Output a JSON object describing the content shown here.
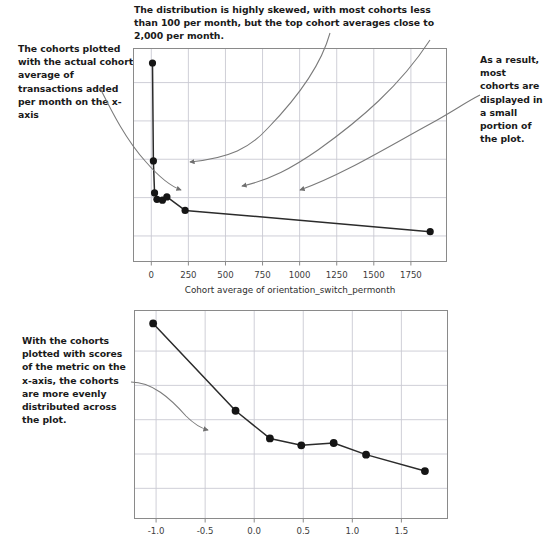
{
  "annotations": {
    "caption_top": "The distribution is highly skewed, with most cohorts less than 100 per month, but the top cohort averages close to 2,000 per month.",
    "left_top": "The cohorts plotted with the actual cohort average of transactions added per month on the x-axis",
    "right_top": "As a result, most cohorts are displayed in a small portion of the plot.",
    "left_bottom": "With the cohorts plotted with scores of the metric on the x-axis, the cohorts are more evenly distributed across the plot."
  },
  "colors": {
    "ink": "#1a1a1a",
    "marker": "#151515",
    "line": "#2b2b2b",
    "grid": "#c9c9d2",
    "frame": "#8a8a8a",
    "arrow": "#7a7a7a",
    "tick_text": "#3c3c3c"
  },
  "chart_data": [
    {
      "type": "line",
      "title": "",
      "subtitle": "",
      "xlabel": "Cohort average of orientation_switch_permonth",
      "ylabel": "",
      "xlim": [
        -120,
        1990
      ],
      "ylim": [
        0,
        10
      ],
      "xticks": [
        0,
        250,
        500,
        750,
        1000,
        1250,
        1500,
        1750
      ],
      "xtick_labels": [
        "0",
        "250",
        "500",
        "750",
        "1000",
        "1250",
        "1500",
        "1750"
      ],
      "yticks": [
        1.2,
        3.0,
        4.8,
        6.6,
        8.4
      ],
      "ytick_labels": [
        "",
        "",
        "",
        "",
        ""
      ],
      "grid": true,
      "legend": "none",
      "series": [
        {
          "name": "cohort retention",
          "marker": "filled-circle",
          "x": [
            8,
            14,
            22,
            38,
            75,
            105,
            228,
            1880
          ],
          "y": [
            9.32,
            4.72,
            3.22,
            2.92,
            2.88,
            3.03,
            2.4,
            1.4
          ]
        }
      ]
    },
    {
      "type": "line",
      "title": "",
      "subtitle": "",
      "xlabel": "",
      "ylabel": "",
      "xlim": [
        -1.22,
        1.97
      ],
      "ylim": [
        0,
        10
      ],
      "xticks": [
        -1.0,
        -0.5,
        0.0,
        0.5,
        1.0,
        1.5
      ],
      "xtick_labels": [
        "-1.0",
        "-0.5",
        "0.0",
        "0.5",
        "1.0",
        "1.5"
      ],
      "yticks": [
        1.45,
        3.1,
        4.75,
        6.4,
        8.05
      ],
      "ytick_labels": [
        "",
        "",
        "",
        "",
        ""
      ],
      "grid": true,
      "legend": "none",
      "series": [
        {
          "name": "cohort retention by metric score",
          "marker": "filled-circle",
          "x": [
            -1.03,
            -0.19,
            0.16,
            0.48,
            0.81,
            1.14,
            1.74
          ],
          "y": [
            9.38,
            5.18,
            3.85,
            3.52,
            3.63,
            3.07,
            2.28
          ]
        }
      ]
    }
  ]
}
